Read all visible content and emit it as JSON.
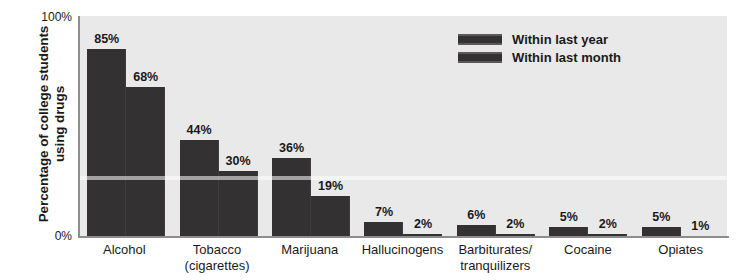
{
  "chart_data": {
    "type": "bar",
    "title": "",
    "xlabel": "",
    "ylabel_line1": "Percentage of college students",
    "ylabel_line2": "using drugs",
    "ylim": [
      0,
      100
    ],
    "yticks": [
      "0%",
      "100%"
    ],
    "ytick_bottom": "0%",
    "ytick_top": "100%",
    "grid": false,
    "legend_position": "top-right",
    "categories": [
      {
        "line1": "Alcohol",
        "line2": ""
      },
      {
        "line1": "Tobacco",
        "line2": "(cigarettes)"
      },
      {
        "line1": "Marijuana",
        "line2": ""
      },
      {
        "line1": "Hallucinogens",
        "line2": ""
      },
      {
        "line1": "Barbiturates/",
        "line2": "tranquilizers"
      },
      {
        "line1": "Cocaine",
        "line2": ""
      },
      {
        "line1": "Opiates",
        "line2": ""
      }
    ],
    "series": [
      {
        "name": "Within last year",
        "color": "#333132",
        "values": [
          85,
          44,
          36,
          7,
          6,
          5,
          5
        ],
        "labels": [
          "85%",
          "44%",
          "36%",
          "7%",
          "6%",
          "5%",
          "5%"
        ]
      },
      {
        "name": "Within last month",
        "color": "#333132",
        "values": [
          68,
          30,
          19,
          2,
          2,
          2,
          1
        ],
        "labels": [
          "68%",
          "30%",
          "19%",
          "2%",
          "2%",
          "2%",
          "1%"
        ]
      }
    ]
  },
  "legend": {
    "items": [
      {
        "label": "Within last year",
        "color": "#333132"
      },
      {
        "label": "Within last month",
        "color": "#333132"
      }
    ]
  },
  "colors": {
    "bar": "#333132",
    "plot_background": "#e9e9e9",
    "axis": "#8d8d8d",
    "text": "#1a1a1a",
    "page_background": "#ffffff"
  }
}
